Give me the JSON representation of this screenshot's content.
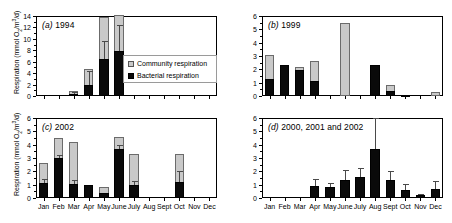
{
  "figure": {
    "axis_label": "Respiration (mmol O2/m3/d)",
    "axis_label_parts": {
      "prefix": "Respiration (mmol O",
      "sub": "2",
      "mid": "/m",
      "sup": "3",
      "suffix": "/d)"
    },
    "legend": {
      "community": "Community respiration",
      "bacterial": "Bacterial respiration"
    },
    "months": [
      "Jan",
      "Feb",
      "Mar",
      "Apr",
      "May",
      "June",
      "July",
      "Aug",
      "Sept",
      "Oct",
      "Nov",
      "Dec"
    ],
    "colors": {
      "community": "#c9c9c9",
      "bacterial": "#0a0a0a",
      "axis": "#000000",
      "error_bar": "#4a4a4a",
      "background": "#ffffff"
    }
  },
  "chart_data": [
    {
      "type": "bar",
      "panel": "a",
      "panel_letter": "(a)",
      "title": "(a) 1994",
      "subtitle": "1994",
      "stacked": true,
      "xlabel": "",
      "ylabel": "Respiration (mmol O2/m3/d)",
      "ylim": [
        0,
        14
      ],
      "yticks": [
        0,
        2,
        4,
        6,
        8,
        10,
        12,
        14
      ],
      "ytick_labels": [
        "0",
        "2",
        "4",
        "6",
        "8",
        "10",
        "12",
        "14"
      ],
      "grid": false,
      "categories": [
        "Jan",
        "Feb",
        "Mar",
        "Apr",
        "May",
        "June",
        "July",
        "Aug",
        "Sept",
        "Oct",
        "Nov",
        "Dec"
      ],
      "series": [
        {
          "name": "Community respiration",
          "values": [
            0,
            0,
            0.85,
            4.8,
            13.9,
            14.2,
            0,
            0,
            0,
            0,
            0,
            0
          ]
        },
        {
          "name": "Bacterial respiration",
          "values": [
            0,
            0,
            0.3,
            2.0,
            6.4,
            7.9,
            0,
            0,
            0,
            0,
            0,
            0
          ]
        }
      ],
      "error_bars": [
        {
          "category": "Mar",
          "value": 0.3,
          "upper": 0.75
        },
        {
          "category": "Apr",
          "value": 2.0,
          "upper": 4.3
        },
        {
          "category": "May",
          "value": 6.4,
          "upper": 9.7
        },
        {
          "category": "June",
          "value": 7.9,
          "upper": 12.5
        }
      ]
    },
    {
      "type": "bar",
      "panel": "b",
      "panel_letter": "(b)",
      "title": "(b) 1999",
      "subtitle": "1999",
      "stacked": true,
      "xlabel": "",
      "ylabel": "",
      "ylim": [
        0,
        6
      ],
      "yticks": [
        0,
        1,
        2,
        3,
        4,
        5,
        6
      ],
      "ytick_labels": [
        "0",
        "1",
        "2",
        "3",
        "4",
        "5",
        "6"
      ],
      "grid": false,
      "categories": [
        "Jan",
        "Feb",
        "Mar",
        "Apr",
        "May",
        "June",
        "July",
        "Aug",
        "Sept",
        "Oct",
        "Nov",
        "Dec"
      ],
      "series": [
        {
          "name": "Community respiration",
          "values": [
            3.05,
            2.35,
            2.15,
            2.65,
            0,
            5.5,
            0,
            2.35,
            0.8,
            0.1,
            0,
            0.3
          ]
        },
        {
          "name": "Bacterial respiration",
          "values": [
            1.25,
            2.35,
            1.95,
            1.15,
            0,
            0,
            0,
            2.35,
            0.35,
            0.05,
            0,
            0
          ]
        }
      ],
      "error_bars": []
    },
    {
      "type": "bar",
      "panel": "c",
      "panel_letter": "(c)",
      "title": "(c) 2002",
      "subtitle": "2002",
      "stacked": true,
      "xlabel": "",
      "ylabel": "Respiration (mmol O2/m3/d)",
      "ylim": [
        0,
        6
      ],
      "yticks": [
        0,
        1,
        2,
        3,
        4,
        5,
        6
      ],
      "ytick_labels": [
        "0",
        "1",
        "2",
        "3",
        "4",
        "5",
        "6"
      ],
      "grid": false,
      "categories": [
        "Jan",
        "Feb",
        "Mar",
        "Apr",
        "May",
        "June",
        "July",
        "Aug",
        "Sept",
        "Oct",
        "Nov",
        "Dec"
      ],
      "series": [
        {
          "name": "Community respiration",
          "values": [
            2.65,
            4.5,
            4.2,
            1.0,
            0.8,
            4.6,
            3.3,
            0,
            0,
            3.3,
            0,
            0
          ]
        },
        {
          "name": "Bacterial respiration",
          "values": [
            1.15,
            3.0,
            1.05,
            0.95,
            0.35,
            3.65,
            1.0,
            0,
            0,
            1.2,
            0,
            0
          ]
        }
      ],
      "error_bars": [
        {
          "category": "Jan",
          "value": 1.15,
          "upper": 1.4
        },
        {
          "category": "Feb",
          "value": 3.0,
          "upper": 3.25
        },
        {
          "category": "Mar",
          "value": 1.05,
          "upper": 1.35
        },
        {
          "category": "June",
          "value": 3.65,
          "upper": 3.95
        },
        {
          "category": "July",
          "value": 1.0,
          "upper": 1.3
        },
        {
          "category": "Oct",
          "value": 1.2,
          "upper": 2.05
        }
      ]
    },
    {
      "type": "bar",
      "panel": "d",
      "panel_letter": "(d)",
      "title": "(d) 2000, 2001 and 2002",
      "subtitle": "2000, 2001 and 2002",
      "stacked": false,
      "xlabel": "",
      "ylabel": "",
      "ylim": [
        0,
        6
      ],
      "yticks": [
        0,
        1,
        2,
        3,
        4,
        5,
        6
      ],
      "ytick_labels": [
        "0",
        "1",
        "2",
        "3",
        "4",
        "5",
        "6"
      ],
      "grid": false,
      "categories": [
        "Jan",
        "Feb",
        "Mar",
        "Apr",
        "May",
        "June",
        "July",
        "Aug",
        "Sept",
        "Oct",
        "Nov",
        "Dec"
      ],
      "series": [
        {
          "name": "Bacterial respiration",
          "values": [
            0,
            0,
            0,
            0.88,
            0.8,
            1.38,
            1.55,
            3.65,
            1.35,
            0.62,
            0.22,
            0.68
          ]
        }
      ],
      "error_bars": [
        {
          "category": "Apr",
          "value": 0.88,
          "upper": 1.45
        },
        {
          "category": "May",
          "value": 0.8,
          "upper": 1.12
        },
        {
          "category": "June",
          "value": 1.38,
          "upper": 2.1
        },
        {
          "category": "July",
          "value": 1.55,
          "upper": 2.25
        },
        {
          "category": "Aug",
          "value": 3.65,
          "upper": 6.0
        },
        {
          "category": "Sept",
          "value": 1.35,
          "upper": 2.05
        },
        {
          "category": "Oct",
          "value": 0.62,
          "upper": 1.05
        },
        {
          "category": "Nov",
          "value": 0.22,
          "upper": 0.32
        },
        {
          "category": "Dec",
          "value": 0.68,
          "upper": 1.3
        }
      ]
    }
  ]
}
